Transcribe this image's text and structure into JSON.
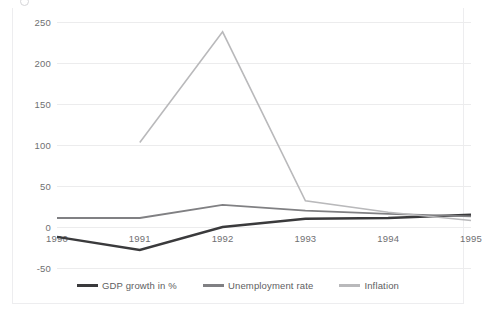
{
  "top_strip": {
    "ghost_text": " ",
    "icon": "circle-badge-icon"
  },
  "chart_data": {
    "type": "line",
    "title": "",
    "subtitle": "",
    "xlabel": "",
    "ylabel": "",
    "x": [
      "1990",
      "1991",
      "1992",
      "1993",
      "1994",
      "1995"
    ],
    "categories": [
      "1990",
      "1991",
      "1992",
      "1993",
      "1994",
      "1995"
    ],
    "series": [
      {
        "name": "GDP growth in %",
        "color": "#3a3a3c",
        "values": [
          -12,
          -28,
          0,
          10,
          11,
          15
        ]
      },
      {
        "name": "Unemployment rate",
        "color": "#808083",
        "values": [
          11,
          11,
          27,
          20,
          16,
          13
        ]
      },
      {
        "name": "Inflation",
        "color": "#b9b9bb",
        "values": [
          null,
          103,
          238,
          32,
          18,
          8
        ]
      }
    ],
    "ylim": [
      -50,
      250
    ],
    "yticks": [
      250,
      200,
      150,
      100,
      50,
      0,
      -50
    ],
    "ytick_labels": [
      "250",
      "200",
      "150",
      "100",
      "50",
      "0",
      "-50"
    ],
    "grid": true,
    "grid_color": "#ececed",
    "legend_position": "bottom",
    "background": "#ffffff",
    "border_color": "#ededef"
  }
}
